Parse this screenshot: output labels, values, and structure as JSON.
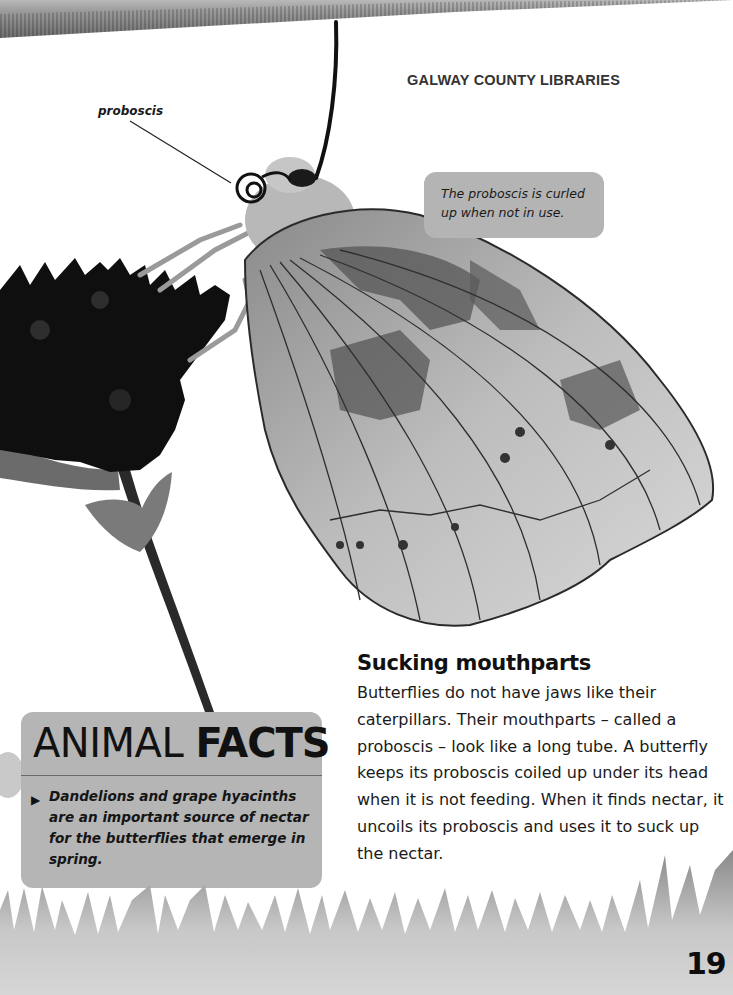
{
  "header": {
    "stamp": "GALWAY COUNTY LIBRARIES"
  },
  "illustration": {
    "subject": "butterfly feeding on flower",
    "label": "proboscis",
    "caption": "The proboscis is curled up when not in use."
  },
  "facts_box": {
    "title_light": "ANIMAL ",
    "title_bold": "FACTS",
    "bullet_icon": "triangle-right-icon",
    "items": [
      "Dandelions and grape hyacinths are an important source of nectar for the butterflies that emerge in spring."
    ]
  },
  "section": {
    "heading": "Sucking mouthparts",
    "body": "Butterflies do not have jaws like their caterpillars. Their mouthparts – called a proboscis – look like a long tube. A butterfly keeps its proboscis coiled up under its head when it is not feeding. When it finds nectar, it uncoils its proboscis and uses it to suck up the nectar."
  },
  "footer": {
    "page_number": "19"
  },
  "colors": {
    "panel_gray": "#b5b5b5",
    "text": "#111111",
    "background": "#ffffff"
  }
}
